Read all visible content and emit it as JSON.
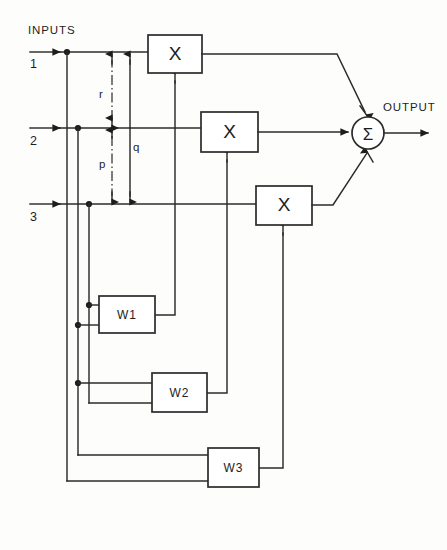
{
  "figure": {
    "title_label": "INPUTS",
    "output_label": "OUTPUT",
    "background_color": "#fdfdfc",
    "line_color": "#2b2b2b"
  },
  "inputs": [
    {
      "id": "in1",
      "label": "1",
      "y": 52
    },
    {
      "id": "in2",
      "label": "2",
      "y": 128
    },
    {
      "id": "in3",
      "label": "3",
      "y": 204
    }
  ],
  "multipliers": [
    {
      "id": "mul1",
      "symbol": "X",
      "x": 148,
      "y": 35,
      "w": 54,
      "h": 38
    },
    {
      "id": "mul2",
      "symbol": "X",
      "x": 201,
      "y": 112,
      "w": 57,
      "h": 40
    },
    {
      "id": "mul3",
      "symbol": "X",
      "x": 256,
      "y": 186,
      "w": 56,
      "h": 39
    }
  ],
  "weights": [
    {
      "id": "w1",
      "label": "W1",
      "x": 99,
      "y": 296,
      "w": 56,
      "h": 37
    },
    {
      "id": "w2",
      "label": "W2",
      "x": 152,
      "y": 373,
      "w": 55,
      "h": 39
    },
    {
      "id": "w3",
      "label": "W3",
      "x": 208,
      "y": 448,
      "w": 51,
      "h": 39
    }
  ],
  "summer": {
    "id": "sum",
    "symbol": "Σ",
    "cx": 368,
    "cy": 133,
    "r": 16
  },
  "variables": [
    {
      "name": "r",
      "x": 99,
      "y": 94
    },
    {
      "name": "q",
      "x": 133,
      "y": 147
    },
    {
      "name": "p",
      "x": 99,
      "y": 164
    }
  ]
}
